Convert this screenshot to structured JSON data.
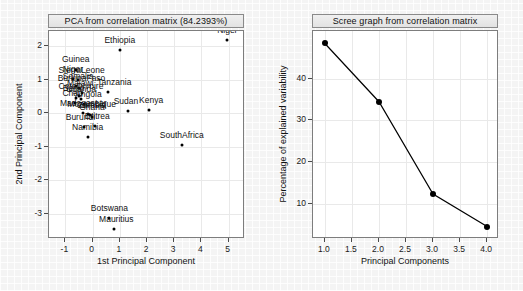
{
  "figure": {
    "panels": [
      "pca",
      "scree"
    ]
  },
  "pca": {
    "title": "PCA from correlation matrix (84.2393%)",
    "xlabel": "1st Principal Component",
    "ylabel": "2nd Principal Component",
    "xticks": [
      "-1",
      "0",
      "1",
      "2",
      "3",
      "4",
      "5"
    ],
    "yticks": [
      "-3",
      "-2",
      "-1",
      "0",
      "1",
      "2"
    ]
  },
  "scree": {
    "title": "Scree graph from correlation matrix",
    "xlabel": "Principal Components",
    "ylabel": "Percentage of explained variability",
    "xticks": [
      "1.0",
      "1.5",
      "2.0",
      "2.5",
      "3.0",
      "3.5",
      "4.0"
    ],
    "yticks": [
      "10",
      "20",
      "30",
      "40"
    ]
  },
  "chart_data": [
    {
      "type": "scatter",
      "id": "pca-biplot",
      "title": "PCA from correlation matrix (84.2393%)",
      "xlabel": "1st Principal Component",
      "ylabel": "2nd Principal Component",
      "xlim": [
        -1.6,
        5.6
      ],
      "ylim": [
        -3.75,
        2.45
      ],
      "xticks": [
        -1,
        0,
        1,
        2,
        3,
        4,
        5
      ],
      "yticks": [
        -3,
        -2,
        -1,
        0,
        1,
        2
      ],
      "grid": true,
      "legend": "none",
      "variance_explained_percent": 84.2393,
      "points": [
        {
          "label": "Niger",
          "x": 4.95,
          "y": 2.18
        },
        {
          "label": "Ethiopia",
          "x": 1.0,
          "y": 1.88
        },
        {
          "label": "Guinea",
          "x": -0.62,
          "y": 1.3
        },
        {
          "label": "Niger2",
          "x": -0.72,
          "y": 1.02
        },
        {
          "label": "SierraLeone",
          "x": -0.55,
          "y": 0.98
        },
        {
          "label": "Somalia",
          "x": -0.6,
          "y": 0.8
        },
        {
          "label": "BurkinaFaso",
          "x": -0.48,
          "y": 0.76
        },
        {
          "label": "Tanzania",
          "x": 0.58,
          "y": 0.62
        },
        {
          "label": "Malawi",
          "x": -0.38,
          "y": 0.6
        },
        {
          "label": "CoteDIvoire",
          "x": -0.5,
          "y": 0.5
        },
        {
          "label": "Benin",
          "x": -0.62,
          "y": 0.46
        },
        {
          "label": "Uganda",
          "x": -0.42,
          "y": 0.42
        },
        {
          "label": "Chad",
          "x": -0.66,
          "y": 0.3
        },
        {
          "label": "Angola",
          "x": -0.3,
          "y": 0.28
        },
        {
          "label": "Sudan",
          "x": 1.3,
          "y": 0.08
        },
        {
          "label": "Kenya",
          "x": 2.08,
          "y": 0.1
        },
        {
          "label": "Madagascar",
          "x": -0.34,
          "y": 0.02
        },
        {
          "label": "Mozambique",
          "x": -0.18,
          "y": -0.02
        },
        {
          "label": "Zambia",
          "x": -0.1,
          "y": -0.06
        },
        {
          "label": "Ghana",
          "x": -0.02,
          "y": -0.1
        },
        {
          "label": "Burundi",
          "x": -0.3,
          "y": -0.4
        },
        {
          "label": "Eritrea",
          "x": 0.1,
          "y": -0.38
        },
        {
          "label": "Namibia",
          "x": -0.18,
          "y": -0.7
        },
        {
          "label": "SouthAfrica",
          "x": 3.28,
          "y": -0.95
        },
        {
          "label": "Botswana",
          "x": 0.62,
          "y": -3.12
        },
        {
          "label": "Mauritius",
          "x": 0.8,
          "y": -3.45
        }
      ]
    },
    {
      "type": "line",
      "id": "scree-plot",
      "title": "Scree graph from correlation matrix",
      "xlabel": "Principal Components",
      "ylabel": "Percentage of explained variability",
      "xlim": [
        0.78,
        4.22
      ],
      "ylim": [
        1.5,
        51.5
      ],
      "xticks": [
        1.0,
        1.5,
        2.0,
        2.5,
        3.0,
        3.5,
        4.0
      ],
      "yticks": [
        10,
        20,
        30,
        40
      ],
      "grid": true,
      "legend": "none",
      "markers": true,
      "x": [
        1,
        2,
        3,
        4
      ],
      "values": [
        48.5,
        34.5,
        12.3,
        4.5
      ],
      "categories": [
        "1",
        "2",
        "3",
        "4"
      ]
    }
  ]
}
